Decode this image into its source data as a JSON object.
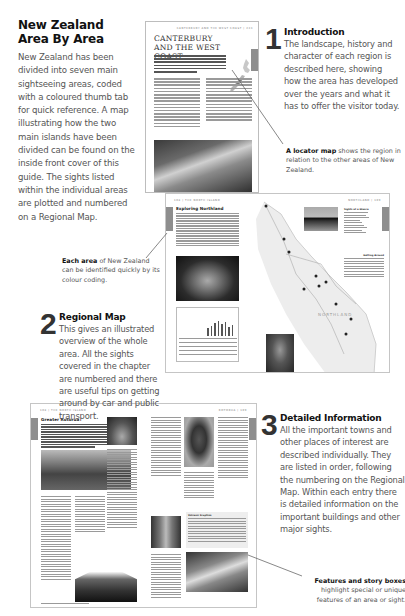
{
  "intro": {
    "title": "New Zealand Area By Area",
    "body": "New Zealand has been divided into seven main sightseeing areas, coded with a coloured thumb tab for quick reference. A map illustrating how the two main islands have been divided can be found on the inside front cover of this guide. The sights listed within the individual areas are plotted and numbered on a Regional Map."
  },
  "steps": [
    {
      "number": "1",
      "title": "Introduction",
      "body": "The landscape, history and character of each region is described here, showing how the area has developed over the years and what it has to offer the visitor today."
    },
    {
      "number": "2",
      "title": "Regional Map",
      "body": "This gives an illustrated overview of the whole area. All the sights covered in the chapter are numbered and there are useful tips on getting around by car and public transport."
    },
    {
      "number": "3",
      "title": "Detailed Information",
      "body": "All the important towns and other places of interest are described individually. They are listed in order, following the numbering on the Regional Map. Within each entry there is detailed information on the important buildings and other major sights."
    }
  ],
  "captions": {
    "locator": {
      "bold": "A locator map",
      "rest": " shows the region in relation to the other areas of New Zealand."
    },
    "each_area": {
      "bold": "Each area",
      "rest": " of New Zealand can be identified quickly by its colour coding."
    },
    "features": {
      "bold": "Features and story boxes",
      "rest": " highlight special or unique features of an area or sight."
    }
  },
  "pages": {
    "canterbury": {
      "header": "CANTERBURY AND THE WEST COAST  |  233",
      "title": "CANTERBURY AND THE WEST COAST"
    },
    "northland": {
      "header_left": "108  |  THE NORTH ISLAND",
      "header_right": "NORTHLAND  |  109",
      "title": "Exploring Northland",
      "map_label": "NORTHLAND",
      "sights_heading": "Sights at a Glance",
      "getting_around": "Getting Around"
    },
    "detail": {
      "header_left": "108  |  THE NORTH ISLAND",
      "header_right": "ROTORUA  |  109",
      "title": "Greater Rotorua",
      "feature_box_title": "Volcanic Eruption"
    }
  },
  "colors": {
    "text_dark": "#111111",
    "text_body": "#555555",
    "thumb_tab": "#8e8e8e",
    "page_border": "#bdbdbd"
  }
}
